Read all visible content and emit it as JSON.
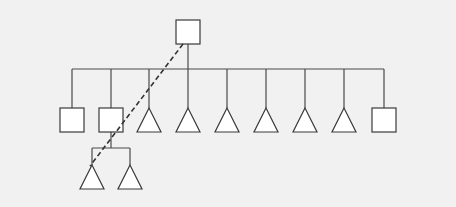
{
  "diagram": {
    "type": "pedigree-tree",
    "background": "#f1f1f1",
    "root": {
      "shape": "square",
      "x": 188,
      "y": 32,
      "size": 24
    },
    "bus_y": 69,
    "children": [
      {
        "shape": "square",
        "x": 72
      },
      {
        "shape": "square",
        "x": 111
      },
      {
        "shape": "triangle",
        "x": 149
      },
      {
        "shape": "triangle",
        "x": 188
      },
      {
        "shape": "triangle",
        "x": 227
      },
      {
        "shape": "triangle",
        "x": 266
      },
      {
        "shape": "triangle",
        "x": 305
      },
      {
        "shape": "triangle",
        "x": 344
      },
      {
        "shape": "square",
        "x": 384
      }
    ],
    "children_top_y": 108,
    "node_size": 24,
    "grandchildren": {
      "parent_index": 1,
      "bus_y": 148,
      "top_y": 165,
      "nodes": [
        {
          "shape": "triangle",
          "x": 92
        },
        {
          "shape": "triangle",
          "x": 130
        }
      ]
    },
    "dashed_line": {
      "from": [
        183,
        44
      ],
      "to": [
        90,
        166
      ]
    }
  }
}
